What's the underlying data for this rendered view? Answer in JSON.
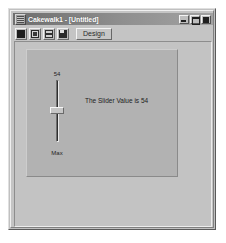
{
  "window": {
    "title": "Cakewalk1 - [Untitled]",
    "icon": "application-icon",
    "buttons": {
      "minimize": "minimize-button",
      "maximize": "maximize-button",
      "close": "close-button"
    }
  },
  "toolbar": {
    "buttons": [
      {
        "name": "record-button",
        "glyph": "glyph-a"
      },
      {
        "name": "settings-button",
        "glyph": "glyph-b"
      },
      {
        "name": "properties-button",
        "glyph": "glyph-c"
      },
      {
        "name": "save-button",
        "glyph": "glyph-d"
      }
    ],
    "design_label": "Design"
  },
  "form": {
    "slider": {
      "value_label": "54",
      "min_label": "Max",
      "value": 54,
      "thumb_position_percent": 44
    },
    "result_text": "The Slider Value is 54"
  },
  "colors": {
    "window_face": "#c0c0c0",
    "panel_face": "#b2b2b2",
    "title_bar_start": "#6e6e6e",
    "title_bar_end": "#a2a2a2",
    "title_text": "#ffffff",
    "body_text": "#1c1c1c"
  },
  "background": {
    "watermark_text": "window library"
  }
}
